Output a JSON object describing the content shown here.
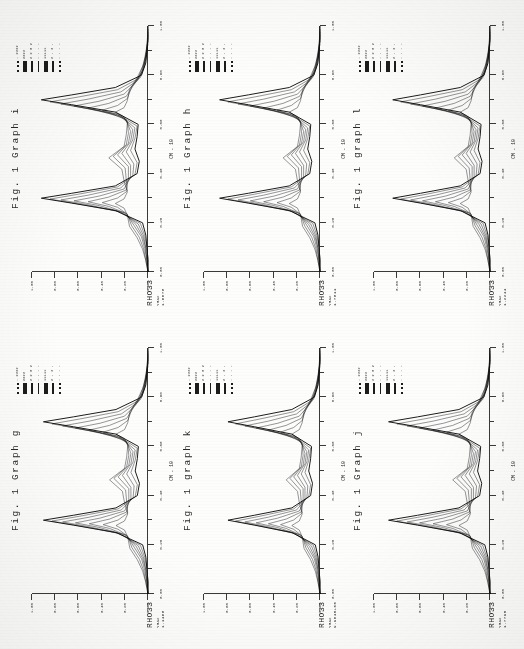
{
  "document": {
    "kind": "scanned-figure-page",
    "orientation": "rotated-90-clockwise",
    "background_color": "#fdfdfc",
    "ink_color": "#111111"
  },
  "panels": [
    {
      "id": "graph-g",
      "caption": "Fig. 1 Graph g",
      "rho_label": "RHO33",
      "rho_sub": "YMAX",
      "rho_value": "1.1468",
      "axis_caption_x": "CM . 10",
      "legend": [
        {
          "style": "dot",
          "text": ". 2222"
        },
        {
          "style": "thick",
          "text": "2222"
        },
        {
          "style": "dash",
          "text": "2 2 8 2"
        },
        {
          "style": "thin",
          "text": "- - - -"
        },
        {
          "style": "thick",
          "text": "11111"
        },
        {
          "style": "dash",
          "text": "2 . 2 ."
        },
        {
          "style": "dot",
          "text": "- - - -"
        }
      ]
    },
    {
      "id": "graph-h",
      "caption": "Fig. 1 Graph h",
      "rho_label": "RHO33",
      "rho_sub": "YMAX",
      "rho_value": "1.7811",
      "axis_caption_x": "CM . 10",
      "legend": [
        {
          "style": "dot",
          "text": ". 2222"
        },
        {
          "style": "thick",
          "text": "2222"
        },
        {
          "style": "dash",
          "text": "2 2 8 2"
        },
        {
          "style": "thin",
          "text": "- - - -"
        },
        {
          "style": "thick",
          "text": "11111"
        },
        {
          "style": "dash",
          "text": "2 . 2 ."
        },
        {
          "style": "dot",
          "text": "- - - -"
        }
      ]
    },
    {
      "id": "graph-i",
      "caption": "Fig. 1 Graph i",
      "rho_label": "RHO33",
      "rho_sub": "YMAX",
      "rho_value": "1.6078",
      "axis_caption_x": "CM . 10",
      "legend": [
        {
          "style": "dot",
          "text": ". 2222"
        },
        {
          "style": "thick",
          "text": "2222"
        },
        {
          "style": "dash",
          "text": "2 2 8 2"
        },
        {
          "style": "thin",
          "text": "- - - -"
        },
        {
          "style": "thick",
          "text": "11111"
        },
        {
          "style": "dash",
          "text": "2 . 2 ."
        },
        {
          "style": "dot",
          "text": "- - - -"
        }
      ]
    },
    {
      "id": "graph-j",
      "caption": "Fig. 1 Graph j",
      "rho_label": "RHO33",
      "rho_sub": "YMAX",
      "rho_value": "1.7795",
      "axis_caption_x": "CM . 10",
      "legend": [
        {
          "style": "dot",
          "text": ". 2222"
        },
        {
          "style": "thick",
          "text": "2222"
        },
        {
          "style": "dash",
          "text": "2 2 8 2"
        },
        {
          "style": "thin",
          "text": "- - - -"
        },
        {
          "style": "thick",
          "text": "11111"
        },
        {
          "style": "dash",
          "text": "2 . 2 ."
        },
        {
          "style": "dot",
          "text": "- - - -"
        }
      ]
    },
    {
      "id": "graph-k",
      "caption": "Fig. 1 graph k",
      "rho_label": "RHO33",
      "rho_sub": "YMAX",
      "rho_value": "9.9045+00",
      "axis_caption_x": "CM . 10",
      "legend": [
        {
          "style": "dot",
          "text": ". 2222"
        },
        {
          "style": "thick",
          "text": "2222"
        },
        {
          "style": "dash",
          "text": "2 2 8 2"
        },
        {
          "style": "thin",
          "text": "- - - -"
        },
        {
          "style": "thick",
          "text": "11111"
        },
        {
          "style": "dash",
          "text": "2 . 2 ."
        },
        {
          "style": "dot",
          "text": "- - - -"
        }
      ]
    },
    {
      "id": "graph-l",
      "caption": "Fig. 1 graph l",
      "rho_label": "RHO33",
      "rho_sub": "YMAX",
      "rho_value": "1.2244",
      "axis_caption_x": "CM . 10",
      "legend": [
        {
          "style": "dot",
          "text": ". 2222"
        },
        {
          "style": "thick",
          "text": "2222"
        },
        {
          "style": "dash",
          "text": "2 2 8 2"
        },
        {
          "style": "thin",
          "text": "- - - -"
        },
        {
          "style": "thick",
          "text": "11111"
        },
        {
          "style": "dash",
          "text": "2 . 2 ."
        },
        {
          "style": "dot",
          "text": "- - - -"
        }
      ]
    }
  ],
  "chart_data": {
    "type": "line",
    "xlabel": "CM . 10",
    "ylabel": "RHO33",
    "xlim": [
      0,
      1.0
    ],
    "ylim": [
      0,
      1.0
    ],
    "grid": false,
    "legend_position": "top-right",
    "x_tick_labels": [
      "0.00",
      "0.10",
      "0.20",
      "0.30",
      "0.40",
      "0.50",
      "0.60",
      "0.70",
      "0.80",
      "0.90",
      "1.00"
    ],
    "y_tick_labels": [
      "0.00",
      "0.20",
      "0.40",
      "0.60",
      "0.80",
      "1.00"
    ],
    "shared_x": [
      0.0,
      0.05,
      0.1,
      0.15,
      0.2,
      0.25,
      0.28,
      0.3,
      0.32,
      0.35,
      0.4,
      0.45,
      0.5,
      0.55,
      0.6,
      0.65,
      0.68,
      0.7,
      0.72,
      0.75,
      0.8,
      0.85,
      0.9,
      0.95,
      1.0
    ],
    "series": [
      {
        "name": "curve-1",
        "values": [
          0.0,
          0.0,
          0.01,
          0.02,
          0.05,
          0.3,
          0.7,
          0.98,
          0.7,
          0.3,
          0.1,
          0.08,
          0.12,
          0.1,
          0.09,
          0.3,
          0.7,
          0.98,
          0.7,
          0.3,
          0.06,
          0.02,
          0.01,
          0.0,
          0.0
        ]
      },
      {
        "name": "curve-2",
        "values": [
          0.0,
          0.0,
          0.01,
          0.03,
          0.07,
          0.28,
          0.64,
          0.9,
          0.64,
          0.28,
          0.12,
          0.1,
          0.16,
          0.12,
          0.1,
          0.28,
          0.64,
          0.9,
          0.64,
          0.28,
          0.07,
          0.03,
          0.01,
          0.0,
          0.0
        ]
      },
      {
        "name": "curve-3",
        "values": [
          0.0,
          0.01,
          0.02,
          0.04,
          0.09,
          0.25,
          0.55,
          0.8,
          0.55,
          0.25,
          0.14,
          0.13,
          0.2,
          0.14,
          0.12,
          0.25,
          0.55,
          0.8,
          0.55,
          0.25,
          0.09,
          0.04,
          0.02,
          0.01,
          0.0
        ]
      },
      {
        "name": "curve-4",
        "values": [
          0.0,
          0.01,
          0.02,
          0.05,
          0.11,
          0.22,
          0.45,
          0.68,
          0.45,
          0.22,
          0.16,
          0.16,
          0.24,
          0.16,
          0.14,
          0.22,
          0.45,
          0.68,
          0.45,
          0.22,
          0.11,
          0.05,
          0.02,
          0.01,
          0.0
        ]
      },
      {
        "name": "curve-5",
        "values": [
          0.0,
          0.01,
          0.03,
          0.06,
          0.13,
          0.2,
          0.36,
          0.55,
          0.36,
          0.2,
          0.18,
          0.18,
          0.28,
          0.18,
          0.16,
          0.2,
          0.36,
          0.55,
          0.36,
          0.2,
          0.13,
          0.06,
          0.03,
          0.01,
          0.0
        ]
      },
      {
        "name": "curve-6",
        "values": [
          0.0,
          0.02,
          0.04,
          0.08,
          0.15,
          0.19,
          0.28,
          0.42,
          0.28,
          0.19,
          0.2,
          0.21,
          0.32,
          0.2,
          0.18,
          0.19,
          0.28,
          0.42,
          0.28,
          0.19,
          0.15,
          0.08,
          0.04,
          0.02,
          0.0
        ]
      },
      {
        "name": "curve-7",
        "values": [
          0.0,
          0.02,
          0.05,
          0.1,
          0.17,
          0.19,
          0.22,
          0.3,
          0.22,
          0.19,
          0.22,
          0.24,
          0.36,
          0.22,
          0.2,
          0.19,
          0.22,
          0.3,
          0.22,
          0.19,
          0.17,
          0.1,
          0.05,
          0.02,
          0.0
        ]
      }
    ]
  }
}
